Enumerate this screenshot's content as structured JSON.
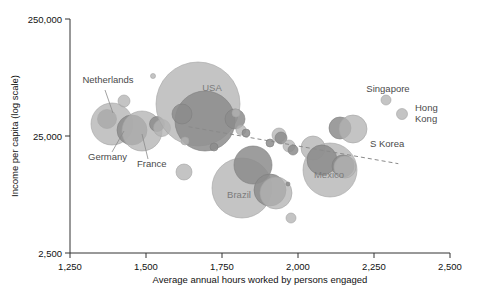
{
  "chart_data": {
    "type": "scatter",
    "title": "",
    "xlabel": "Average annual hours worked by persons engaged",
    "ylabel": "Income per capita (log scale)",
    "xlim": [
      1250,
      2500
    ],
    "ylim": [
      2500,
      250000
    ],
    "yscale": "log",
    "grid": false,
    "legend": null,
    "xticks": [
      "1,250",
      "1,500",
      "1,750",
      "2,000",
      "2,250",
      "2,500"
    ],
    "xtick_values": [
      1250,
      1500,
      1750,
      2000,
      2250,
      2500
    ],
    "yticks": [
      "250,000",
      "25,000",
      "2,500"
    ],
    "ytick_values": [
      250000,
      25000,
      2500
    ],
    "size_meaning": "bubble area proportional to population / economy size",
    "trendline": {
      "style": "dashed",
      "color": "#8a8a8a",
      "x_start": 1640,
      "y_start": 30000,
      "x_end": 2330,
      "y_end": 14500
    },
    "annotations": [
      {
        "label": "Netherlands",
        "x": 108,
        "y": 83,
        "anchor": "middle"
      },
      {
        "label": "Germany",
        "x": 88,
        "y": 160,
        "anchor": "start"
      },
      {
        "label": "France",
        "x": 137,
        "y": 167,
        "anchor": "start"
      },
      {
        "label": "USA",
        "x": 212,
        "y": 91,
        "anchor": "middle"
      },
      {
        "label": "Brazil",
        "x": 239,
        "y": 198,
        "anchor": "middle"
      },
      {
        "label": "Mexico",
        "x": 329,
        "y": 178,
        "anchor": "middle"
      },
      {
        "label": "Singapore",
        "x": 388,
        "y": 92,
        "anchor": "middle"
      },
      {
        "label": "Hong",
        "x": 415,
        "y": 111,
        "anchor": "start"
      },
      {
        "label": "Kong",
        "x": 415,
        "y": 122,
        "anchor": "start"
      },
      {
        "label": "S Korea",
        "x": 370,
        "y": 147,
        "anchor": "start"
      }
    ],
    "points": [
      {
        "name": "Netherlands",
        "hours": 1381,
        "income": 42000,
        "cx": 107,
        "cy": 119,
        "r": 9.5,
        "tone": "dark"
      },
      {
        "name": "Germany",
        "hours": 1390,
        "income": 37000,
        "cx": 112,
        "cy": 124,
        "r": 21,
        "tone": "light"
      },
      {
        "name": "nl-small-top",
        "hours": 1432,
        "income": 56000,
        "cx": 124,
        "cy": 101,
        "r": 6,
        "tone": "light"
      },
      {
        "name": "france-dark",
        "hours": 1470,
        "income": 33000,
        "cx": 132,
        "cy": 130,
        "r": 15,
        "tone": "dark"
      },
      {
        "name": "France",
        "hours": 1498,
        "income": 31000,
        "cx": 142,
        "cy": 131,
        "r": 20,
        "tone": "light"
      },
      {
        "name": "eu-mid-a",
        "hours": 1540,
        "income": 33000,
        "cx": 157,
        "cy": 124,
        "r": 7.5,
        "tone": "dark"
      },
      {
        "name": "eu-mid-b",
        "hours": 1552,
        "income": 31000,
        "cx": 162,
        "cy": 128,
        "r": 8.5,
        "tone": "light"
      },
      {
        "name": "tiny-top",
        "hours": 1510,
        "income": 98000,
        "cx": 153,
        "cy": 76,
        "r": 2.5,
        "tone": "light"
      },
      {
        "name": "USA",
        "hours": 1700,
        "income": 43000,
        "cx": 198,
        "cy": 104,
        "r": 42,
        "tone": "light"
      },
      {
        "name": "usa-dark-core",
        "hours": 1720,
        "income": 30000,
        "cx": 205,
        "cy": 121,
        "r": 30,
        "tone": "dark"
      },
      {
        "name": "usa-dk-left",
        "hours": 1650,
        "income": 34000,
        "cx": 182,
        "cy": 114,
        "r": 10,
        "tone": "dark"
      },
      {
        "name": "usa-dk-right",
        "hours": 1800,
        "income": 30000,
        "cx": 235,
        "cy": 119,
        "r": 10,
        "tone": "dark"
      },
      {
        "name": "usa-sm-lowleft",
        "hours": 1660,
        "income": 23000,
        "cx": 185,
        "cy": 141,
        "r": 4,
        "tone": "light"
      },
      {
        "name": "usa-sm-low",
        "hours": 1745,
        "income": 21000,
        "cx": 214,
        "cy": 147,
        "r": 4,
        "tone": "dark"
      },
      {
        "name": "edge-a",
        "hours": 1812,
        "income": 27000,
        "cx": 241,
        "cy": 130,
        "r": 5,
        "tone": "light"
      },
      {
        "name": "edge-b",
        "hours": 1826,
        "income": 26000,
        "cx": 246,
        "cy": 133,
        "r": 4,
        "tone": "dark"
      },
      {
        "name": "edge-c",
        "hours": 1800,
        "income": 34000,
        "cx": 236,
        "cy": 113,
        "r": 4,
        "tone": "light"
      },
      {
        "name": "mid-float",
        "hours": 1655,
        "income": 15000,
        "cx": 184,
        "cy": 172,
        "r": 8,
        "tone": "light"
      },
      {
        "name": "Brazil",
        "hours": 1850,
        "income": 12500,
        "cx": 242,
        "cy": 188,
        "r": 30,
        "tone": "light"
      },
      {
        "name": "br-dark-top",
        "hours": 1860,
        "income": 17000,
        "cx": 253,
        "cy": 165,
        "r": 19,
        "tone": "dark"
      },
      {
        "name": "br-dark-low",
        "hours": 1905,
        "income": 12000,
        "cx": 270,
        "cy": 190,
        "r": 16,
        "tone": "dark"
      },
      {
        "name": "br-light-low",
        "hours": 1915,
        "income": 11500,
        "cx": 276,
        "cy": 193,
        "r": 16,
        "tone": "light"
      },
      {
        "name": "br-tiny",
        "hours": 1945,
        "income": 13000,
        "cx": 288,
        "cy": 184,
        "r": 2,
        "tone": "dark"
      },
      {
        "name": "br-bottom-dot",
        "hours": 1960,
        "income": 7200,
        "cx": 291,
        "cy": 218,
        "r": 5,
        "tone": "light"
      },
      {
        "name": "mid-cluster-a",
        "hours": 1930,
        "income": 25000,
        "cx": 279,
        "cy": 135,
        "r": 7,
        "tone": "light"
      },
      {
        "name": "mid-cluster-b",
        "hours": 1935,
        "income": 24000,
        "cx": 281,
        "cy": 138,
        "r": 6,
        "tone": "dark"
      },
      {
        "name": "mid-cluster-c",
        "hours": 1955,
        "income": 22000,
        "cx": 289,
        "cy": 146,
        "r": 6,
        "tone": "light"
      },
      {
        "name": "mid-cluster-d",
        "hours": 1965,
        "income": 21000,
        "cx": 293,
        "cy": 150,
        "r": 5,
        "tone": "dark"
      },
      {
        "name": "mid-cluster-e",
        "hours": 1900,
        "income": 23000,
        "cx": 270,
        "cy": 143,
        "r": 4,
        "tone": "dark"
      },
      {
        "name": "Mexico",
        "hours": 2085,
        "income": 15500,
        "cx": 330,
        "cy": 170,
        "r": 27,
        "tone": "light"
      },
      {
        "name": "mx-dark-top",
        "hours": 2045,
        "income": 22000,
        "cx": 313,
        "cy": 148,
        "r": 12,
        "tone": "light"
      },
      {
        "name": "mx-dark-core",
        "hours": 2065,
        "income": 18000,
        "cx": 322,
        "cy": 160,
        "r": 15,
        "tone": "dark"
      },
      {
        "name": "mx-right-dark",
        "hours": 2115,
        "income": 16500,
        "cx": 343,
        "cy": 166,
        "r": 11,
        "tone": "dark"
      },
      {
        "name": "mx-right-light",
        "hours": 2120,
        "income": 16000,
        "cx": 345,
        "cy": 167,
        "r": 11,
        "tone": "light"
      },
      {
        "name": "SKorea-dark",
        "hours": 2190,
        "income": 27000,
        "cx": 340,
        "cy": 128,
        "r": 11,
        "tone": "dark"
      },
      {
        "name": "SKorea-light",
        "hours": 2215,
        "income": 26000,
        "cx": 353,
        "cy": 129,
        "r": 14,
        "tone": "light"
      },
      {
        "name": "Singapore",
        "hours": 2285,
        "income": 55000,
        "cx": 386,
        "cy": 100,
        "r": 5,
        "tone": "light"
      },
      {
        "name": "HongKong",
        "hours": 2350,
        "income": 44000,
        "cx": 402,
        "cy": 114,
        "r": 5.5,
        "tone": "light"
      }
    ],
    "colors": {
      "bubble_light": "#b3b3b3",
      "bubble_dark": "#8c8c8c",
      "axis": "#333333",
      "label": "#7b7b7b",
      "annotation": "#4a4a4a",
      "trendline": "#8a8a8a",
      "background": "#ffffff"
    }
  }
}
